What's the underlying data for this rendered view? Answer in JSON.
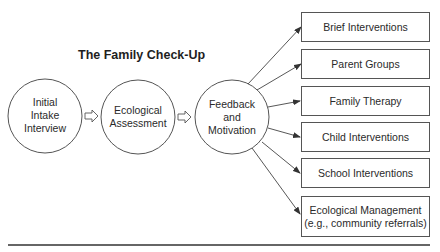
{
  "title": "The Family Check-Up",
  "steps": [
    {
      "lines": [
        "Initial",
        "Intake",
        "Interview"
      ]
    },
    {
      "lines": [
        "Ecological",
        "Assessment"
      ]
    },
    {
      "lines": [
        "Feedback",
        "and",
        "Motivation"
      ]
    }
  ],
  "outcomes": [
    {
      "lines": [
        "Brief Interventions"
      ]
    },
    {
      "lines": [
        "Parent Groups"
      ]
    },
    {
      "lines": [
        "Family Therapy"
      ]
    },
    {
      "lines": [
        "Child Interventions"
      ]
    },
    {
      "lines": [
        "School Interventions"
      ]
    },
    {
      "lines": [
        "Ecological Management",
        "(e.g., community referrals)"
      ]
    }
  ],
  "colors": {
    "stroke": "#555555",
    "text": "#2a2a2a"
  }
}
